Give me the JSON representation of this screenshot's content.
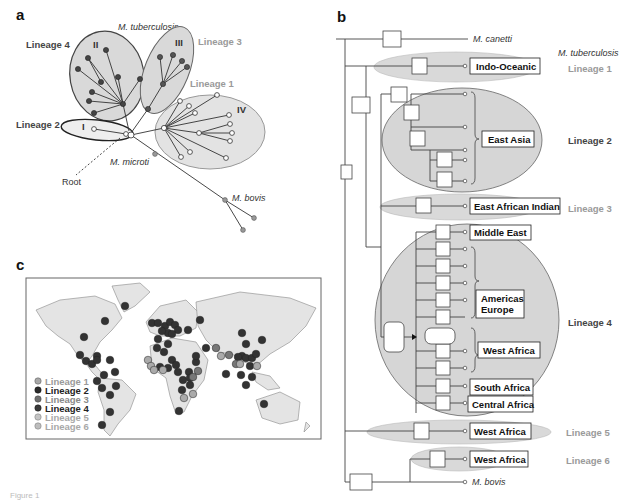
{
  "figure": {
    "caption": "Figure 1"
  },
  "panel_a": {
    "label": "a",
    "title": "M. tuberculosis",
    "lineages": [
      {
        "name": "Lineage 4",
        "clade": "II",
        "color": "#555555",
        "tone": "dark"
      },
      {
        "name": "Lineage 3",
        "clade": "III",
        "color": "#777777",
        "tone": "light"
      },
      {
        "name": "Lineage 1",
        "clade": "IV",
        "color": "#dddddd",
        "tone": "light"
      },
      {
        "name": "Lineage 2",
        "clade": "I",
        "color": "#ffffff",
        "tone": "dark"
      }
    ],
    "labels": {
      "root": "Root",
      "microti": "M. microti",
      "bovis": "M. bovis"
    }
  },
  "panel_b": {
    "label": "b",
    "outgroup_top": "M. canetti",
    "title": "M. tuberculosis",
    "outgroup_bottom": "M. bovis",
    "lineages": [
      {
        "name": "Lineage 1",
        "regions": [
          "Indo-Oceanic"
        ],
        "tone": "light"
      },
      {
        "name": "Lineage 2",
        "regions": [
          "East Asia"
        ],
        "tone": "dark"
      },
      {
        "name": "Lineage 3",
        "regions": [
          "East African Indian"
        ],
        "tone": "light"
      },
      {
        "name": "Lineage 4",
        "regions": [
          "Middle East",
          "Americas Europe",
          "West Africa",
          "South Africa",
          "Central Africa"
        ],
        "tone": "dark"
      },
      {
        "name": "Lineage 5",
        "regions": [
          "West Africa"
        ],
        "tone": "light"
      },
      {
        "name": "Lineage 6",
        "regions": [
          "West Africa"
        ],
        "tone": "light"
      }
    ],
    "region_labels": {
      "indo_oceanic": "Indo-Oceanic",
      "east_asia": "East Asia",
      "east_african_indian": "East African Indian",
      "middle_east": "Middle East",
      "americas": "Americas",
      "europe": "Europe",
      "west_africa_l4": "West Africa",
      "south_africa": "South Africa",
      "central_africa": "Central Africa",
      "west_africa_l5": "West Africa",
      "west_africa_l6": "West Africa"
    }
  },
  "panel_c": {
    "label": "c",
    "legend": [
      {
        "label": "Lineage 1",
        "color": "#a8a8a8",
        "text_color": "#9a9a9a"
      },
      {
        "label": "Lineage 2",
        "color": "#2a2a2a",
        "text_color": "#222222"
      },
      {
        "label": "Lineage 3",
        "color": "#6f6f6f",
        "text_color": "#8a8a8a"
      },
      {
        "label": "Lineage 4",
        "color": "#3a3a3a",
        "text_color": "#222222"
      },
      {
        "label": "Lineage 5",
        "color": "#c4c4c4",
        "text_color": "#a8a8a8"
      },
      {
        "label": "Lineage 6",
        "color": "#bdbdbd",
        "text_color": "#a8a8a8"
      }
    ]
  }
}
